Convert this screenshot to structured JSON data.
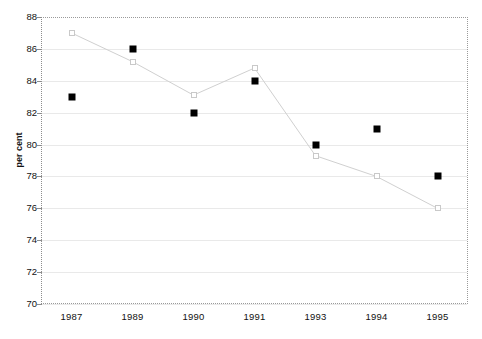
{
  "chart_data": {
    "type": "line",
    "title": "",
    "xlabel": "",
    "ylabel": "per cent",
    "categories": [
      "1987",
      "1989",
      "1990",
      "1991",
      "1993",
      "1994",
      "1995"
    ],
    "ylim": [
      70,
      88
    ],
    "yticks": [
      70,
      72,
      74,
      76,
      78,
      80,
      82,
      84,
      86,
      88
    ],
    "grid": true,
    "legend": "none",
    "series": [
      {
        "name": "series-dark",
        "marker": "filled-square",
        "color": "#000000",
        "line": false,
        "values": [
          83,
          86,
          82,
          84,
          80,
          81,
          78
        ]
      },
      {
        "name": "series-light",
        "marker": "open-square",
        "color": "#d0d0d0",
        "line": true,
        "values": [
          87,
          85.2,
          83.1,
          84.8,
          79.3,
          78,
          76
        ]
      }
    ]
  },
  "axis": {
    "y_title": "per cent",
    "y_tick_labels": [
      "88",
      "86",
      "84",
      "82",
      "80",
      "78",
      "76",
      "74",
      "72",
      "70"
    ],
    "x_tick_labels": [
      "1987",
      "1989",
      "1990",
      "1991",
      "1993",
      "1994",
      "1995"
    ]
  }
}
